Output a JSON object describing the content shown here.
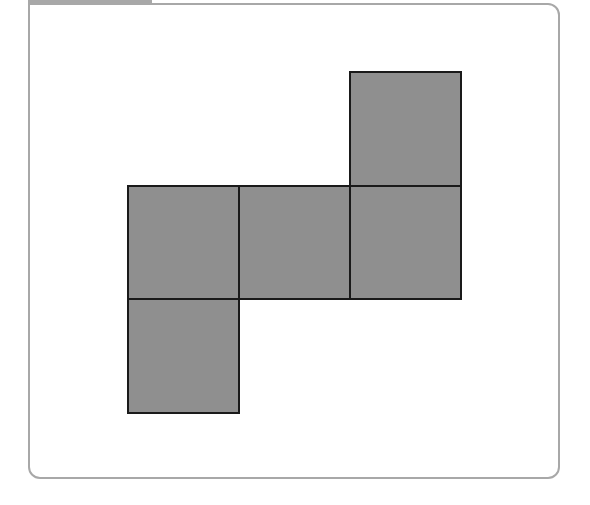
{
  "diagram": {
    "fill_color": "#8f8f8f",
    "stroke_color": "#1a1a1a",
    "frame_color": "#a8a8a8",
    "squares": [
      {
        "id": "top-right",
        "row": 0,
        "col": 2
      },
      {
        "id": "middle-left",
        "row": 1,
        "col": 0
      },
      {
        "id": "middle-center",
        "row": 1,
        "col": 1
      },
      {
        "id": "middle-right",
        "row": 1,
        "col": 2
      },
      {
        "id": "bottom-left",
        "row": 2,
        "col": 0
      }
    ]
  }
}
